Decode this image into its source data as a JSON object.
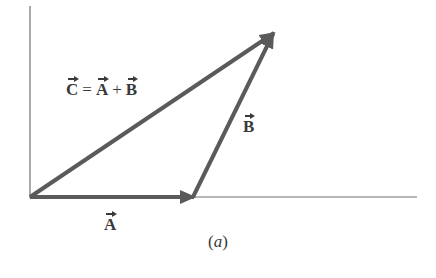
{
  "figure": {
    "caption_open": "(",
    "caption_letter": "a",
    "caption_close": ")",
    "colors": {
      "vector": "#5a5a5a",
      "axis": "#707070",
      "text": "#3a3a3a"
    }
  },
  "labels": {
    "C": "C",
    "eq": "=",
    "A1": "A",
    "plus": "+",
    "B1": "B",
    "B": "B",
    "A": "A"
  },
  "diagram": {
    "origin": [
      30,
      197
    ],
    "vectors": [
      {
        "name": "A",
        "from": [
          30,
          197
        ],
        "to": [
          192,
          197
        ]
      },
      {
        "name": "B",
        "from": [
          192,
          197
        ],
        "to": [
          273,
          33
        ]
      },
      {
        "name": "C = A + B",
        "from": [
          30,
          197
        ],
        "to": [
          273,
          33
        ]
      }
    ]
  }
}
